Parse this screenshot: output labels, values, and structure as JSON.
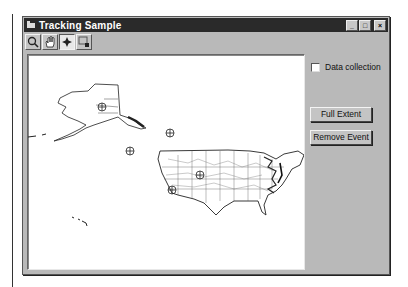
{
  "window": {
    "title": "Tracking Sample",
    "controls": {
      "minimize": "_",
      "maximize": "□",
      "close": "×"
    }
  },
  "toolbar": {
    "tools": [
      {
        "name": "zoom-in",
        "icon": "magnifier-icon",
        "glyph": "🔍",
        "active": false
      },
      {
        "name": "pan",
        "icon": "hand-icon",
        "glyph": "✋",
        "active": false
      },
      {
        "name": "add-event",
        "icon": "crosshair-icon",
        "glyph": "✛",
        "active": true
      },
      {
        "name": "select",
        "icon": "select-arrow-icon",
        "glyph": "◳",
        "active": false
      }
    ]
  },
  "map": {
    "background": "#ffffff",
    "events": [
      {
        "label": "event-alaska",
        "x": 74,
        "y": 52
      },
      {
        "label": "event-pacific-north",
        "x": 142,
        "y": 78
      },
      {
        "label": "event-pacific-south",
        "x": 102,
        "y": 96
      },
      {
        "label": "event-kansas",
        "x": 172,
        "y": 120
      },
      {
        "label": "event-california",
        "x": 144,
        "y": 135
      }
    ]
  },
  "sidebar": {
    "data_collection": {
      "label": "Data collection",
      "checked": false
    },
    "full_extent_label": "Full Extent",
    "remove_event_label": "Remove Event"
  }
}
